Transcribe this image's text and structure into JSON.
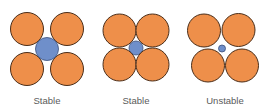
{
  "title": "",
  "colors": {
    "large_ion": "#ee8f4a",
    "small_ion": "#6f8fca",
    "outline": "#4a2e1a",
    "small_outline": "#3c4f78",
    "label": "#5a5a5a"
  },
  "panels": [
    {
      "label": "Stable",
      "large": [
        {
          "cx": 27,
          "cy": 29,
          "r": 16.5
        },
        {
          "cx": 67,
          "cy": 29,
          "r": 16.5
        },
        {
          "cx": 27,
          "cy": 69,
          "r": 16.5
        },
        {
          "cx": 67,
          "cy": 69,
          "r": 16.5
        }
      ],
      "small": {
        "cx": 47,
        "cy": 49,
        "r": 11.5
      },
      "label_x": 47
    },
    {
      "label": "Stable",
      "large": [
        {
          "cx": 119.5,
          "cy": 30.5,
          "r": 16.5
        },
        {
          "cx": 152.5,
          "cy": 30.5,
          "r": 16.5
        },
        {
          "cx": 119.5,
          "cy": 64.5,
          "r": 16.5
        },
        {
          "cx": 152.5,
          "cy": 64.5,
          "r": 16.5
        }
      ],
      "small": {
        "cx": 136,
        "cy": 48,
        "r": 7
      },
      "label_x": 136
    },
    {
      "label": "Unstable",
      "large": [
        {
          "cx": 204,
          "cy": 30.5,
          "r": 16.5
        },
        {
          "cx": 238.5,
          "cy": 30,
          "r": 16.5
        },
        {
          "cx": 208,
          "cy": 65.5,
          "r": 16.5
        },
        {
          "cx": 242,
          "cy": 65.5,
          "r": 16.5
        }
      ],
      "small": {
        "cx": 222,
        "cy": 48.5,
        "r": 3.5
      },
      "label_x": 225
    }
  ]
}
